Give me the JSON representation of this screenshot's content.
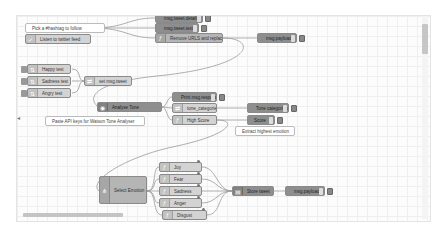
{
  "canvas": {
    "comments": [
      {
        "id": "c1",
        "text": "Pick a #hashtag to follow"
      },
      {
        "id": "c2",
        "text": "Paste API keys for Watson Tone Analyser"
      },
      {
        "id": "c3",
        "text": "Extract highest emotion"
      }
    ],
    "nodes": {
      "twitter_in": "Listen to twitter feed",
      "msg_tweet_details": "msg.tweet.details",
      "msg_tweet_text": "msg.tweet.text",
      "remove_urls": "Remove URLS and replace &",
      "msg_payload_debug": "msg.payload",
      "happy_test": "Happy test",
      "sadness_test": "Sadness test",
      "angry_test": "Angry test",
      "set_msg_tweet": "set msg.tweet",
      "analyse_tone": "Analyse Tone",
      "print_msg_response": "Print msg.response",
      "tone_categories": "tone_categories",
      "tone_categories_debug": "Tone categories",
      "high_score": "High Score",
      "score_debug": "Score",
      "select_emotion": "Select Emotion",
      "joy": "Joy",
      "fear": "Fear",
      "sadness": "Sadness",
      "anger": "Anger",
      "disgust": "Disgust",
      "store_tweet": "Store tweet",
      "msg_payload_debug2": "msg.payload"
    }
  },
  "scroll": {
    "left_arrow": "◂"
  },
  "colors": {
    "canvas_bg": "#fcfcfc",
    "grid": "#efefef",
    "node_dark": "#8e8e8e",
    "node_mid": "#b5b5b5",
    "node_light": "#d3d3d3",
    "wire": "#999999"
  }
}
